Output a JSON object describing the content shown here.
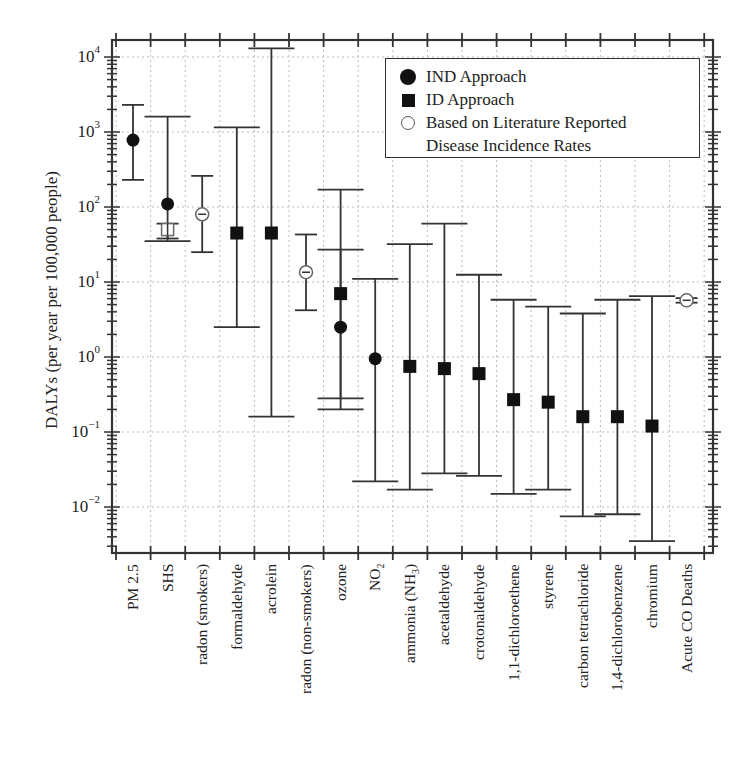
{
  "chart_data": {
    "type": "scatter",
    "subtype": "log-scale point estimates with error bars",
    "title": "",
    "xlabel": "",
    "ylabel": "DALYs (per year per 100,000 people)",
    "yscale": "log",
    "ylim": [
      0.0025,
      16000
    ],
    "y_ticks": [
      "10^-2",
      "10^-1",
      "10^0",
      "10^1",
      "10^2",
      "10^3",
      "10^4"
    ],
    "grid": true,
    "legend_position": "upper right",
    "categories": [
      "PM 2.5",
      "SHS",
      "radon (smokers)",
      "formaldehyde",
      "acrolein",
      "radon (non-smokers)",
      "ozone",
      "NO2",
      "ammonia (NH3)",
      "acetaldehyde",
      "crotonaldehyde",
      "1,1-dichloroethene",
      "styrene",
      "carbon tetrachloride",
      "1,4-dichlorobenzene",
      "chromium",
      "Acute CO Deaths"
    ],
    "series": [
      {
        "name": "IND Approach",
        "marker": "filled-circle",
        "points": [
          {
            "category": "PM 2.5",
            "value": 780,
            "low": 230,
            "high": 2300
          },
          {
            "category": "SHS",
            "value": 110,
            "low": 35,
            "high": 1600
          },
          {
            "category": "ozone",
            "value": 2.5,
            "low": 0.2,
            "high": 27
          },
          {
            "category": "NO2",
            "value": 0.95,
            "low": 0.022,
            "high": 11
          }
        ]
      },
      {
        "name": "ID Approach",
        "marker": "filled-square",
        "points": [
          {
            "category": "formaldehyde",
            "value": 45,
            "low": 2.5,
            "high": 1150
          },
          {
            "category": "acrolein",
            "value": 45,
            "low": 0.16,
            "high": 13000
          },
          {
            "category": "ozone",
            "value": 7,
            "low": 0.28,
            "high": 170
          },
          {
            "category": "ammonia (NH3)",
            "value": 0.75,
            "low": 0.017,
            "high": 32
          },
          {
            "category": "acetaldehyde",
            "value": 0.7,
            "low": 0.028,
            "high": 60
          },
          {
            "category": "crotonaldehyde",
            "value": 0.6,
            "low": 0.026,
            "high": 12.5
          },
          {
            "category": "1,1-dichloroethene",
            "value": 0.27,
            "low": 0.015,
            "high": 5.8
          },
          {
            "category": "styrene",
            "value": 0.25,
            "low": 0.017,
            "high": 4.7
          },
          {
            "category": "carbon tetrachloride",
            "value": 0.16,
            "low": 0.0075,
            "high": 3.8
          },
          {
            "category": "1,4-dichlorobenzene",
            "value": 0.16,
            "low": 0.008,
            "high": 5.8
          },
          {
            "category": "chromium",
            "value": 0.12,
            "low": 0.0035,
            "high": 6.5
          }
        ]
      },
      {
        "name": "Based on Literature Reported Disease Incidence Rates",
        "marker": "open-circle",
        "points": [
          {
            "category": "SHS",
            "value": 50,
            "low": 38,
            "high": 60,
            "marker_override": "open-square"
          },
          {
            "category": "radon (smokers)",
            "value": 80,
            "low": 25,
            "high": 260
          },
          {
            "category": "radon (non-smokers)",
            "value": 13.5,
            "low": 4.2,
            "high": 43
          },
          {
            "category": "Acute CO Deaths",
            "value": 5.7,
            "low": 5.3,
            "high": 6.1
          }
        ]
      }
    ]
  },
  "axis": {
    "ylabel": "DALYs (per year per 100,000 people)",
    "yticks": [
      {
        "base": "10",
        "exp": "4",
        "pos": 57
      },
      {
        "base": "10",
        "exp": "3",
        "pos": 132
      },
      {
        "base": "10",
        "exp": "2",
        "pos": 207
      },
      {
        "base": "10",
        "exp": "1",
        "pos": 282
      },
      {
        "base": "10",
        "exp": "0",
        "pos": 357
      },
      {
        "base": "10",
        "exp": "−1",
        "pos": 432
      },
      {
        "base": "10",
        "exp": "−2",
        "pos": 507
      }
    ],
    "xlabels": [
      {
        "main": "PM 2.5",
        "sub": "",
        "tail": ""
      },
      {
        "main": "SHS",
        "sub": "",
        "tail": ""
      },
      {
        "main": "radon (smokers)",
        "sub": "",
        "tail": ""
      },
      {
        "main": "formaldehyde",
        "sub": "",
        "tail": ""
      },
      {
        "main": "acrolein",
        "sub": "",
        "tail": ""
      },
      {
        "main": "radon (non-smokers)",
        "sub": "",
        "tail": ""
      },
      {
        "main": "ozone",
        "sub": "",
        "tail": ""
      },
      {
        "main": "NO",
        "sub": "2",
        "tail": ""
      },
      {
        "main": "ammonia (NH",
        "sub": "3",
        "tail": ")"
      },
      {
        "main": "acetaldehyde",
        "sub": "",
        "tail": ""
      },
      {
        "main": "crotonaldehyde",
        "sub": "",
        "tail": ""
      },
      {
        "main": "1,1-dichloroethene",
        "sub": "",
        "tail": ""
      },
      {
        "main": "styrene",
        "sub": "",
        "tail": ""
      },
      {
        "main": "carbon tetrachloride",
        "sub": "",
        "tail": ""
      },
      {
        "main": "1,4-dichlorobenzene",
        "sub": "",
        "tail": ""
      },
      {
        "main": "chromium",
        "sub": "",
        "tail": ""
      },
      {
        "main": "Acute CO Deaths",
        "sub": "",
        "tail": ""
      }
    ]
  },
  "legend": {
    "items": [
      {
        "label": "IND Approach",
        "symbol": "filled-circle"
      },
      {
        "label": "ID Approach",
        "symbol": "filled-square"
      },
      {
        "label": "Based on Literature Reported",
        "symbol": "open-circle"
      },
      {
        "label": "Disease Incidence Rates",
        "symbol": ""
      }
    ]
  },
  "colors": {
    "axis": "#333333",
    "marker": "#111111",
    "open_marker": "#666666",
    "grid": "#bbbbbb"
  }
}
